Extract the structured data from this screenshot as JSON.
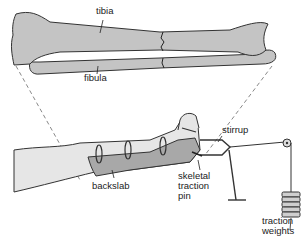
{
  "figure": {
    "labels": {
      "tibia": "tibia",
      "fibula": "fibula",
      "stirrup": "stirrup",
      "skeletal_traction_pin": [
        "skeletal",
        "traction",
        "pin"
      ],
      "backslab": "backslab",
      "traction_weights": [
        "traction",
        "weights"
      ]
    }
  },
  "colors": {
    "bone": "#c4c4c4",
    "backslab": "#a8a8a8",
    "skin": "#e6e6e6",
    "outline": "#333333",
    "background": "#ffffff"
  }
}
